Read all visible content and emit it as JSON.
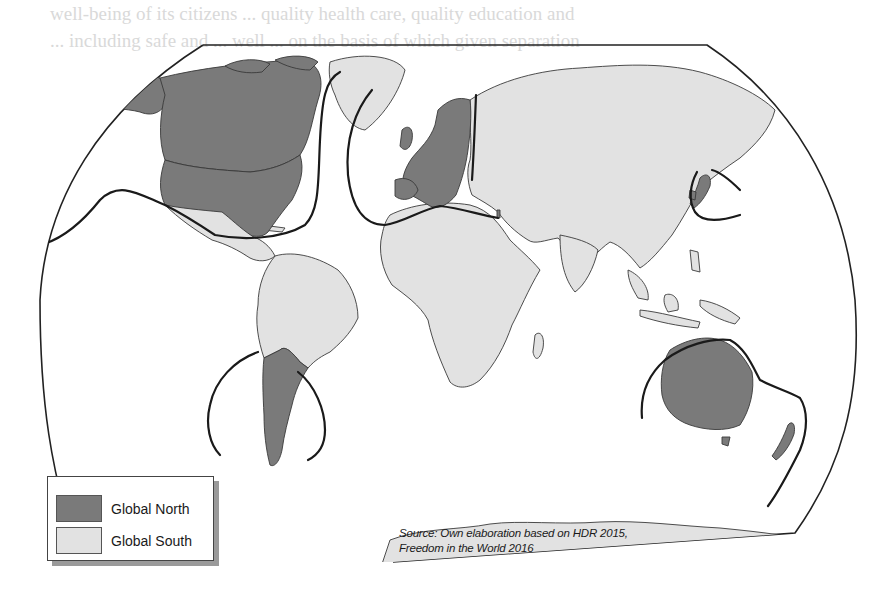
{
  "figure": {
    "type": "choropleth-world-map",
    "projection": "Robinson-like truncated ellipse",
    "colors": {
      "global_north": "#7a7a7a",
      "global_south": "#e2e2e2",
      "ocean": "#ffffff",
      "divide_line": "#1a1a1a",
      "border": "#3a3a3a"
    }
  },
  "legend": {
    "items": [
      {
        "label": "Global North",
        "color": "#7a7a7a"
      },
      {
        "label": "Global South",
        "color": "#e2e2e2"
      }
    ]
  },
  "source": {
    "line1": "Source: Own elaboration based on HDR 2015,",
    "line2": "Freedom in the World 2016"
  },
  "regions": {
    "global_north": [
      "North America (USA, Canada)",
      "Greenland excluded",
      "Europe",
      "Japan",
      "South Korea",
      "Israel",
      "Australia",
      "New Zealand",
      "Chile",
      "Argentina",
      "Uruguay"
    ],
    "global_south": [
      "Latin America",
      "Africa",
      "Middle East",
      "Russia",
      "Central Asia",
      "South Asia",
      "East Asia",
      "Southeast Asia",
      "Greenland"
    ]
  },
  "background_text": {
    "lines": [
      "well-being of its citizens ... quality health care, quality education and",
      "... including safe and ... well ... on the basis of which given separation",
      "... between ... governments ... of ... public goods ... complex ...",
      "... the ... government ... formal ... governance ... the ...",
      "... world ... ",
      "... assess-",
      "... resources",
      "... and ...",
      "... ",
      "... ",
      "... and free ... ",
      "... countries ...",
      "between ... under ...",
      "... ",
      "... and ...",
      "... ",
      "... ",
      "... ",
      "... ",
      "... and free ... in the ... and ...",
      "... the ... North ... to ... countries ...",
      "between ... Japan ... territories ... ",
      "within ... ... ... ... ... ... ...",
      "weighed ... The ... majority ... stress ... data ... questions about pol",
      "... and safety issues ... which refers ... that some governments ..."
    ]
  }
}
